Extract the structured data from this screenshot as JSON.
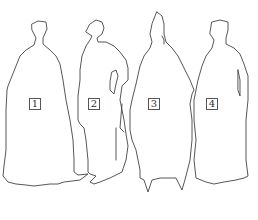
{
  "figures": [
    {
      "id": 1,
      "label": "1"
    },
    {
      "id": 2,
      "label": "2"
    },
    {
      "id": 3,
      "label": "3"
    },
    {
      "id": 4,
      "label": "4"
    }
  ],
  "colors": {
    "outline": "#444444",
    "background": "#ffffff",
    "label_border": "#555555"
  }
}
